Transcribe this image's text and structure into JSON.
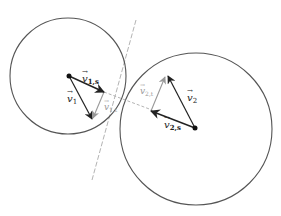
{
  "colors": {
    "outline": "#555555",
    "vector": "#222222",
    "tangential": "#999999",
    "tangent_line": "#aaaaaa",
    "dash": "#aaaaaa"
  },
  "labels": {
    "v1": "v⃗1",
    "v1_main": "v",
    "v1_sub": "1",
    "v1s_main": "v",
    "v1s_sub": "1,s",
    "v1t_main": "v",
    "v1t_sub": "1,t",
    "v2_main": "v",
    "v2_sub": "2",
    "v2s_main": "v",
    "v2s_sub": "2,s",
    "v2t_main": "v",
    "v2t_sub": "2,t",
    "arrow_mark": "→"
  }
}
